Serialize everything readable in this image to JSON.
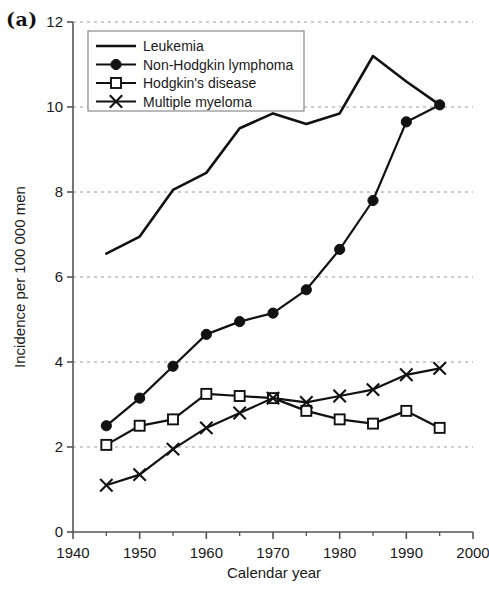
{
  "panel": {
    "label": "(a)"
  },
  "chart_data": {
    "type": "line",
    "title": "",
    "xlabel": "Calendar year",
    "ylabel": "Incidence per 100 000 men",
    "xlim": [
      1940,
      2000
    ],
    "ylim": [
      0,
      12
    ],
    "xticks": [
      1940,
      1950,
      1960,
      1970,
      1980,
      1990,
      2000
    ],
    "xtick_labels": [
      "1940",
      "1950",
      "1960",
      "1970",
      "1980",
      "1990",
      "2000"
    ],
    "xminor_ticks": [
      1945,
      1955,
      1965,
      1975,
      1985,
      1995
    ],
    "yticks": [
      0,
      2,
      4,
      6,
      8,
      10,
      12
    ],
    "ytick_labels": [
      "0",
      "2",
      "4",
      "6",
      "8",
      "10",
      "12"
    ],
    "grid": "horizontal-dashed",
    "legend_position": "top-left-inside",
    "x": [
      1945,
      1950,
      1955,
      1960,
      1965,
      1970,
      1975,
      1980,
      1985,
      1990,
      1995
    ],
    "series": [
      {
        "name": "Leukemia",
        "marker": "none",
        "values": [
          6.55,
          6.95,
          8.05,
          8.45,
          9.5,
          9.85,
          9.6,
          9.85,
          11.2,
          10.6,
          10.05
        ]
      },
      {
        "name": "Non-Hodgkin lymphoma",
        "marker": "filled-circle",
        "values": [
          2.5,
          3.15,
          3.9,
          4.65,
          4.95,
          5.15,
          5.7,
          6.65,
          7.8,
          9.65,
          10.05
        ]
      },
      {
        "name": "Hodgkin's disease",
        "marker": "open-square",
        "values": [
          2.05,
          2.5,
          2.65,
          3.25,
          3.2,
          3.15,
          2.85,
          2.65,
          2.55,
          2.85,
          2.45
        ]
      },
      {
        "name": "Multiple myeloma",
        "marker": "cross-x",
        "values": [
          1.1,
          1.35,
          1.95,
          2.45,
          2.8,
          3.15,
          3.05,
          3.2,
          3.35,
          3.7,
          3.85
        ]
      }
    ],
    "colors": {
      "line": "#111111",
      "grid": "#9a9a9a",
      "axis": "#555555",
      "text": "#1a1a1a",
      "background": "#ffffff"
    }
  }
}
